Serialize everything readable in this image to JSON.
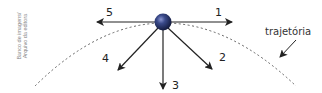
{
  "figure": {
    "credit_lines": [
      "Banco de imagens/",
      "Arquivo da editora"
    ],
    "trajectory_label": "trajetória",
    "arrows": [
      {
        "id": "1",
        "label": "1",
        "direction": "right"
      },
      {
        "id": "2",
        "label": "2",
        "direction": "down-right"
      },
      {
        "id": "3",
        "label": "3",
        "direction": "down"
      },
      {
        "id": "4",
        "label": "4",
        "direction": "down-left"
      },
      {
        "id": "5",
        "label": "5",
        "direction": "left"
      }
    ],
    "colors": {
      "ball": "#1e2a5a",
      "ball_highlight": "#7a86c4",
      "arrow": "#222222",
      "trajectory": "#555555",
      "credit_text": "#888888"
    }
  }
}
